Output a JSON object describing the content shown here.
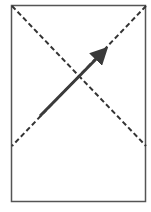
{
  "diagram": {
    "frame": {
      "x": 11,
      "y": 5,
      "width": 135,
      "height": 197,
      "stroke": "#555555"
    },
    "diagonal_1": {
      "x1": 12,
      "y1": 6,
      "x2": 146,
      "y2": 146,
      "style": "dashed",
      "color": "#333333"
    },
    "diagonal_2": {
      "x1": 146,
      "y1": 6,
      "x2": 12,
      "y2": 146,
      "style": "dashed",
      "color": "#333333"
    },
    "arrow": {
      "x1": 40,
      "y1": 116,
      "x2": 110,
      "y2": 45,
      "color": "#3a3a3a"
    }
  }
}
